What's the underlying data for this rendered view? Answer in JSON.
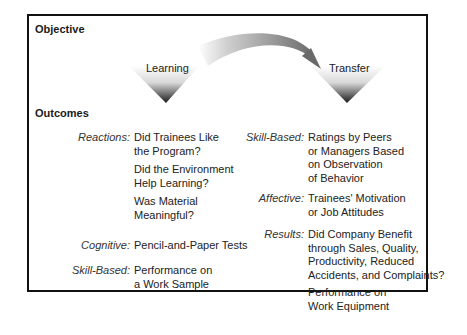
{
  "headings": {
    "objective": "Objective",
    "outcomes": "Outcomes"
  },
  "diagram": {
    "left_triangle_label": "Learning",
    "right_triangle_label": "Transfer",
    "arrow": "curved-arrow from Learning to Transfer"
  },
  "left_column": [
    {
      "category": "Reactions:",
      "items": [
        "Did Trainees Like\nthe Program?",
        "Did the Environment\nHelp Learning?",
        "Was Material\nMeaningful?"
      ]
    },
    {
      "category": "Cognitive:",
      "items": [
        "Pencil-and-Paper Tests"
      ]
    },
    {
      "category": "Skill-Based:",
      "items": [
        "Performance on\na Work Sample"
      ]
    }
  ],
  "right_column": [
    {
      "category": "Skill-Based:",
      "items": [
        "Ratings by Peers\nor Managers Based\non Observation\nof Behavior"
      ]
    },
    {
      "category": "Affective:",
      "items": [
        "Trainees' Motivation\nor Job Attitudes"
      ]
    },
    {
      "category": "Results:",
      "items": [
        "Did Company Benefit\nthrough Sales, Quality,\nProductivity, Reduced\nAccidents, and Complaints?",
        "Performance on\nWork Equipment"
      ]
    }
  ],
  "text": {
    "l_react": "Reactions:",
    "l_react_1a": "Did Trainees Like",
    "l_react_1b": "the Program?",
    "l_react_2a": "Did the Environment",
    "l_react_2b": "Help Learning?",
    "l_react_3a": "Was Material",
    "l_react_3b": "Meaningful?",
    "l_cog": "Cognitive:",
    "l_cog_1": "Pencil-and-Paper Tests",
    "l_skill": "Skill-Based:",
    "l_skill_1a": "Performance on",
    "l_skill_1b": "a Work Sample",
    "r_skill": "Skill-Based:",
    "r_skill_1a": "Ratings by Peers",
    "r_skill_1b": "or Managers Based",
    "r_skill_1c": "on Observation",
    "r_skill_1d": "of Behavior",
    "r_aff": "Affective:",
    "r_aff_1a": "Trainees' Motivation",
    "r_aff_1b": "or Job Attitudes",
    "r_res": "Results:",
    "r_res_1a": "Did Company Benefit",
    "r_res_1b": "through Sales, Quality,",
    "r_res_1c": "Productivity, Reduced",
    "r_res_1d": "Accidents, and Complaints?",
    "r_res_2a": "Performance on",
    "r_res_2b": "Work Equipment"
  }
}
